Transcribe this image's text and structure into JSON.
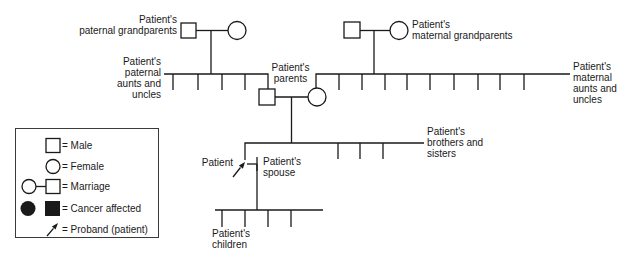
{
  "diagram": {
    "labels": {
      "paternal_grandparents": "Patient's\npaternal grandparents",
      "maternal_grandparents": "Patient's\nmaternal grandparents",
      "paternal_aunts_uncles": "Patient's\npaternal\naunts and\nuncles",
      "parents": "Patient's\nparents",
      "maternal_aunts_uncles": "Patient's\nmaternal\naunts and\nuncles",
      "brothers_sisters": "Patient's\nbrothers and\nsisters",
      "patient": "Patient",
      "spouse": "Patient's\nspouse",
      "children": "Patient's\nchildren"
    },
    "structure": {
      "paternal_aunts_uncles_count": 4,
      "maternal_aunts_uncles_count": 9,
      "siblings_count": 3,
      "children_count": 4
    }
  },
  "legend": {
    "items": [
      {
        "icon": "male-square-icon",
        "label": "= Male"
      },
      {
        "icon": "female-circle-icon",
        "label": "= Female"
      },
      {
        "icon": "marriage-icon",
        "label": "= Marriage"
      },
      {
        "icon": "cancer-affected-icon",
        "label": "= Cancer affected"
      },
      {
        "icon": "proband-arrow-icon",
        "label": "= Proband (patient)"
      }
    ]
  },
  "colors": {
    "line": "#1a1a1a",
    "background": "#ffffff"
  }
}
